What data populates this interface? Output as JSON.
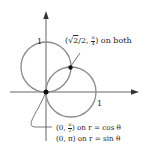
{
  "diagram": {
    "colors": {
      "curve": "#8a8a8a",
      "axis": "#555555",
      "point": "#111111",
      "text": "#222222"
    },
    "axes": {
      "x_tick_label": "1",
      "y_tick_label": "1"
    },
    "curves": [
      {
        "name": "r = sin θ",
        "center": [
          0,
          0.5
        ],
        "radius": 0.5
      },
      {
        "name": "r = cos θ",
        "center": [
          0.5,
          0
        ],
        "radius": 0.5
      }
    ],
    "annotations": {
      "intersection": {
        "open": "(",
        "sqrt": "√",
        "sqrt_arg": "2",
        "after_sqrt": "/2, ",
        "frac_num": "π",
        "frac_den": "4",
        "close": ")",
        "suffix": " on both"
      },
      "origin_cos": {
        "prefix": "(0, ",
        "frac_num": "π",
        "frac_den": "2",
        "suffix": ") on r = cos θ"
      },
      "origin_sin": {
        "text": "(0, π) on r = sin θ"
      }
    }
  }
}
